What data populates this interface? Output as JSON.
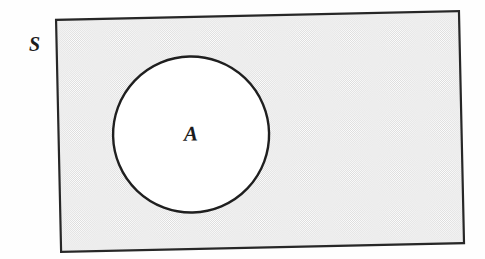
{
  "figure": {
    "type": "venn-diagram",
    "caption_present": false,
    "background_color": "#fefefe",
    "universe": {
      "label": "S",
      "name": "sample-space-rectangle",
      "shaded": true,
      "fill_style": "halftone-stipple",
      "fill_color": "#dcdcdc",
      "fill_base_color": "#ffffff",
      "border_color": "#272727",
      "border_width_px": 2.2,
      "x": 58,
      "y": 14,
      "width": 404,
      "height": 233,
      "rotation_deg": -1.2,
      "label_position": {
        "x": 29,
        "y": 51
      }
    },
    "subset": {
      "label": "A",
      "name": "event-circle",
      "shaded": false,
      "fill_color": "#ffffff",
      "border_color": "#1f1f1f",
      "border_width_px": 2.4,
      "center_x": 191,
      "center_y": 131,
      "radius": 78,
      "label_position": {
        "x": 191,
        "y": 137
      }
    }
  }
}
